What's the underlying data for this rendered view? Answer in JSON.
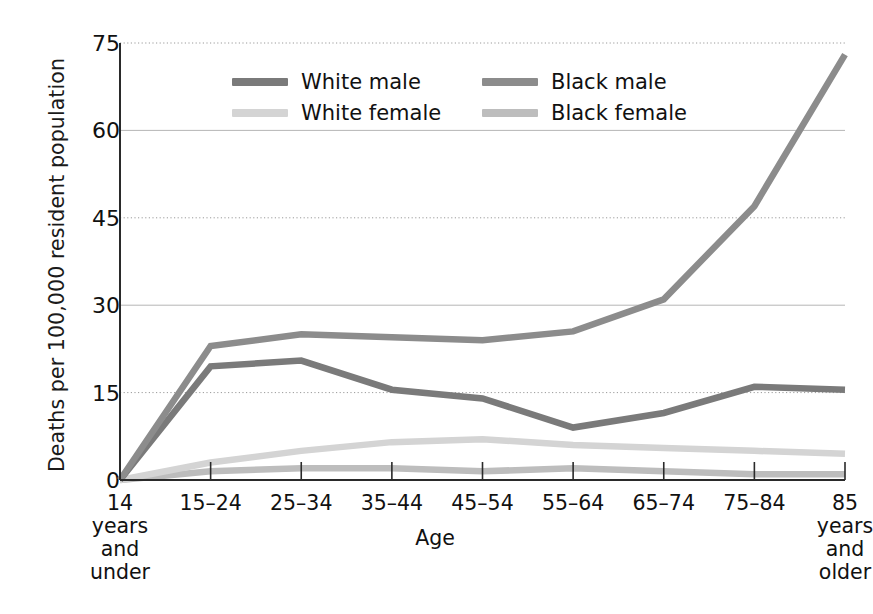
{
  "chart_data": {
    "type": "line",
    "title": "",
    "xlabel": "Age",
    "ylabel": "Deaths per 100,000 resident population",
    "categories": [
      "14\nyears\nand\nunder",
      "15–24",
      "25–34",
      "35–44",
      "45–54",
      "55–64",
      "65–74",
      "75–84",
      "85\nyears\nand\nolder"
    ],
    "ytick_labels": [
      "0",
      "15",
      "30",
      "45",
      "60",
      "75"
    ],
    "ytick_values": [
      0,
      15,
      30,
      45,
      60,
      75
    ],
    "ylim": [
      0,
      78
    ],
    "grid": "horizontal",
    "legend_position": "top-center",
    "series": [
      {
        "name": "White male",
        "color": "#7a7a7a",
        "values": [
          0,
          19.5,
          20.5,
          15.5,
          14,
          9,
          11.5,
          16,
          15.5
        ]
      },
      {
        "name": "Black male",
        "color": "#8c8c8c",
        "values": [
          0,
          23,
          25,
          24.5,
          24,
          25.5,
          31,
          47,
          73
        ]
      },
      {
        "name": "White female",
        "color": "#d4d4d4",
        "values": [
          0,
          3,
          5,
          6.5,
          7,
          6,
          5.5,
          5,
          4.5
        ]
      },
      {
        "name": "Black female",
        "color": "#bdbdbd",
        "values": [
          0,
          1.5,
          2,
          2,
          1.5,
          2,
          1.5,
          1,
          1
        ]
      }
    ]
  },
  "legend": {
    "items": [
      {
        "label": "White male",
        "color": "#7a7a7a"
      },
      {
        "label": "Black male",
        "color": "#8c8c8c"
      },
      {
        "label": "White female",
        "color": "#d4d4d4"
      },
      {
        "label": "Black female",
        "color": "#bdbdbd"
      }
    ]
  },
  "axes": {
    "y_title": "Deaths per 100,000 resident population",
    "x_title": "Age"
  }
}
